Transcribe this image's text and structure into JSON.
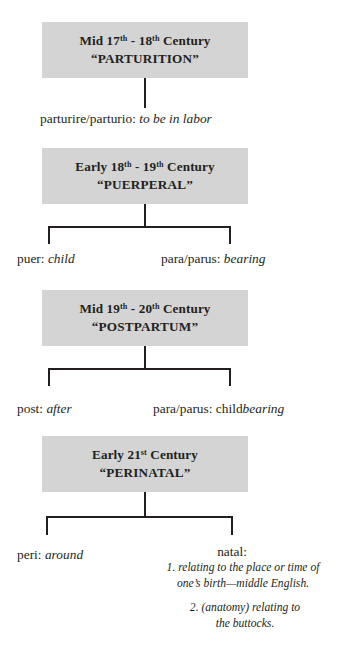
{
  "diagram": {
    "box_fill": "#d4d4d4",
    "line_color": "#231f20",
    "stages": [
      {
        "era_prefix": "Mid 17",
        "era_sup1": "th",
        "era_mid": " - 18",
        "era_sup2": "th",
        "era_suffix": " Century",
        "term": "“PARTURITION”",
        "roots": [
          {
            "root": "parturire/parturio: ",
            "meaning": "to be in labor"
          }
        ]
      },
      {
        "era_prefix": "Early 18",
        "era_sup1": "th",
        "era_mid": " - 19",
        "era_sup2": "th",
        "era_suffix": " Century",
        "term": "“PUERPERAL”",
        "roots": [
          {
            "root": "puer: ",
            "meaning": "child"
          },
          {
            "root": "para/parus: ",
            "meaning": "bearing"
          }
        ]
      },
      {
        "era_prefix": "Mid 19",
        "era_sup1": "th",
        "era_mid": " - 20",
        "era_sup2": "th",
        "era_suffix": " Century",
        "term": "“POSTPARTUM”",
        "roots": [
          {
            "root": "post: ",
            "meaning": "after"
          },
          {
            "root": "para/parus: child",
            "meaning": "bearing"
          }
        ]
      },
      {
        "era_prefix": "Early 21",
        "era_sup1": "st",
        "era_mid": "",
        "era_sup2": "",
        "era_suffix": " Century",
        "term": "“PERINATAL”",
        "roots": [
          {
            "root": "peri: ",
            "meaning": "around"
          },
          {
            "root": "natal:",
            "meaning": ""
          }
        ]
      }
    ],
    "natal_definitions": {
      "head": "natal:",
      "def1_line1": "1. relating to the place or time of",
      "def1_line2": "one’s birth—middle English.",
      "def2_line1": "2. (anatomy) relating to",
      "def2_line2": "the buttocks."
    }
  }
}
